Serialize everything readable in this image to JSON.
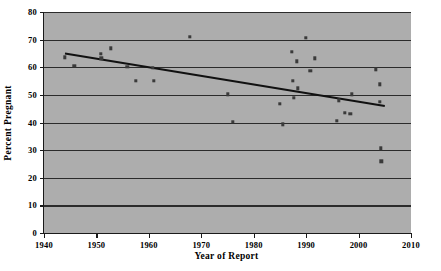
{
  "chart_data": {
    "type": "scatter",
    "title": "",
    "xlabel": "Year of Report",
    "ylabel": "Percent Pregnant",
    "xlim": [
      1940,
      2010
    ],
    "ylim": [
      0,
      80
    ],
    "xticks": [
      1940,
      1950,
      1960,
      1970,
      1980,
      1990,
      2000,
      2010
    ],
    "yticks": [
      0,
      10,
      20,
      30,
      40,
      50,
      60,
      70,
      80
    ],
    "grid": "horizontal",
    "legend": "none",
    "marker": "square",
    "marker_color": "#3a3a3a",
    "plot_background": "#adadad",
    "gridline_color": "#2b2b2b",
    "axis_color": "#1a1a1a",
    "series": [
      {
        "name": "Percent Pregnant by Year of Report",
        "points": [
          {
            "x": 1944.0,
            "y": 63.6
          },
          {
            "x": 1945.8,
            "y": 60.5
          },
          {
            "x": 1950.8,
            "y": 64.8
          },
          {
            "x": 1950.9,
            "y": 63.3
          },
          {
            "x": 1952.8,
            "y": 66.9
          },
          {
            "x": 1955.9,
            "y": 60.2
          },
          {
            "x": 1957.5,
            "y": 55.1
          },
          {
            "x": 1960.7,
            "y": 59.7
          },
          {
            "x": 1961.0,
            "y": 55.2
          },
          {
            "x": 1967.8,
            "y": 71.0
          },
          {
            "x": 1975.1,
            "y": 50.2
          },
          {
            "x": 1976.0,
            "y": 40.2
          },
          {
            "x": 1985.0,
            "y": 46.7
          },
          {
            "x": 1985.5,
            "y": 39.4
          },
          {
            "x": 1987.3,
            "y": 65.7
          },
          {
            "x": 1987.4,
            "y": 55.2
          },
          {
            "x": 1987.6,
            "y": 48.9
          },
          {
            "x": 1988.2,
            "y": 62.2
          },
          {
            "x": 1988.4,
            "y": 52.4
          },
          {
            "x": 1989.9,
            "y": 70.6
          },
          {
            "x": 1990.8,
            "y": 58.8
          },
          {
            "x": 1991.6,
            "y": 63.2
          },
          {
            "x": 1995.9,
            "y": 40.6
          },
          {
            "x": 1996.2,
            "y": 48.1
          },
          {
            "x": 1997.4,
            "y": 43.5
          },
          {
            "x": 1998.4,
            "y": 43.1
          },
          {
            "x": 1998.7,
            "y": 50.2
          },
          {
            "x": 2003.3,
            "y": 59.3
          },
          {
            "x": 2004.0,
            "y": 53.8
          },
          {
            "x": 2004.1,
            "y": 47.6
          },
          {
            "x": 2004.2,
            "y": 30.7
          },
          {
            "x": 2004.3,
            "y": 25.9
          }
        ]
      }
    ],
    "trendline": {
      "type": "linear",
      "x_start": 1944.0,
      "y_start": 65.0,
      "x_end": 2005.0,
      "y_end": 46.0,
      "color": "#111111",
      "width_px": 2.0
    }
  }
}
